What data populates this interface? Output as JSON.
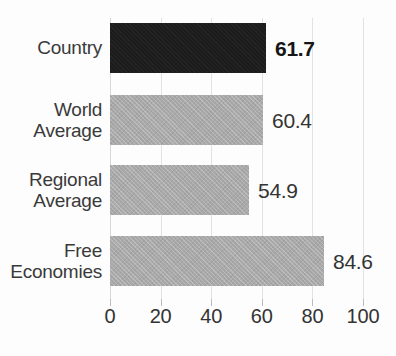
{
  "chart_data": {
    "type": "bar",
    "orientation": "horizontal",
    "title": "",
    "xlabel": "",
    "ylabel": "",
    "xlim": [
      0,
      100
    ],
    "xticks": [
      0,
      20,
      40,
      60,
      80,
      100
    ],
    "xtick_labels": [
      "0",
      "20",
      "40",
      "60",
      "80",
      "100"
    ],
    "grid": true,
    "grid_axis": "x",
    "legend": "none",
    "categories": [
      "Country",
      "World Average",
      "Regional Average",
      "Free Economies"
    ],
    "values": [
      61.7,
      60.4,
      54.9,
      84.6
    ],
    "value_labels": [
      "61.7",
      "60.4",
      "54.9",
      "84.6"
    ],
    "bars": [
      {
        "category": "Country",
        "category_lines": [
          "Country"
        ],
        "value": 61.7,
        "value_label": "61.7",
        "color": "#1c1c1c",
        "highlight": true
      },
      {
        "category": "World Average",
        "category_lines": [
          "World",
          "Average"
        ],
        "value": 60.4,
        "value_label": "60.4",
        "color": "#a9a9a9",
        "highlight": false
      },
      {
        "category": "Regional Average",
        "category_lines": [
          "Regional",
          "Average"
        ],
        "value": 54.9,
        "value_label": "54.9",
        "color": "#a9a9a9",
        "highlight": false
      },
      {
        "category": "Free Economies",
        "category_lines": [
          "Free",
          "Economies"
        ],
        "value": 84.6,
        "value_label": "84.6",
        "color": "#a9a9a9",
        "highlight": false
      }
    ],
    "colors": {
      "highlight_bar": "#1c1c1c",
      "default_bar": "#a9a9a9",
      "gridline": "#e2e2e4",
      "text": "#333333",
      "background": "#fdfdfd"
    }
  }
}
